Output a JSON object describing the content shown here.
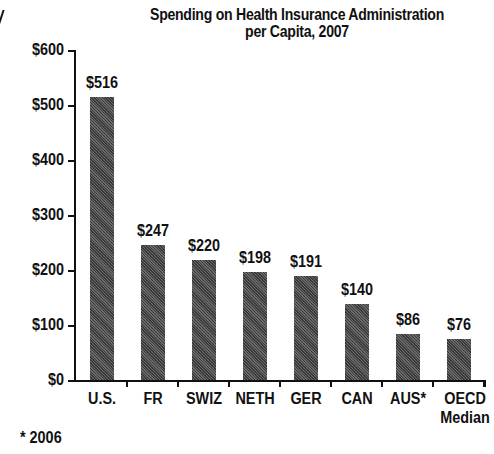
{
  "chart_data": {
    "type": "bar",
    "title": "Spending on Health Insurance Administration per Capita, 2007",
    "title_lines": [
      "Spending on Health Insurance Administration",
      "per Capita, 2007"
    ],
    "xlabel": "",
    "ylabel": "",
    "categories": [
      "U.S.",
      "FR",
      "SWIZ",
      "NETH",
      "GER",
      "CAN",
      "AUS*",
      "OECD Median"
    ],
    "category_lines": [
      [
        "U.S."
      ],
      [
        "FR"
      ],
      [
        "SWIZ"
      ],
      [
        "NETH"
      ],
      [
        "GER"
      ],
      [
        "CAN"
      ],
      [
        "AUS*"
      ],
      [
        "OECD",
        "Median"
      ]
    ],
    "values": [
      516,
      247,
      220,
      198,
      191,
      140,
      86,
      76
    ],
    "data_labels": [
      "$516",
      "$247",
      "$220",
      "$198",
      "$191",
      "$140",
      "$86",
      "$76"
    ],
    "ylim": [
      0,
      600
    ],
    "yticks": [
      0,
      100,
      200,
      300,
      400,
      500,
      600
    ],
    "ytick_labels": [
      "$0",
      "$100",
      "$200",
      "$300",
      "$400",
      "$500",
      "$600"
    ],
    "grid": false,
    "legend": null,
    "bar_color": "#555555",
    "footnote": "* 2006"
  }
}
